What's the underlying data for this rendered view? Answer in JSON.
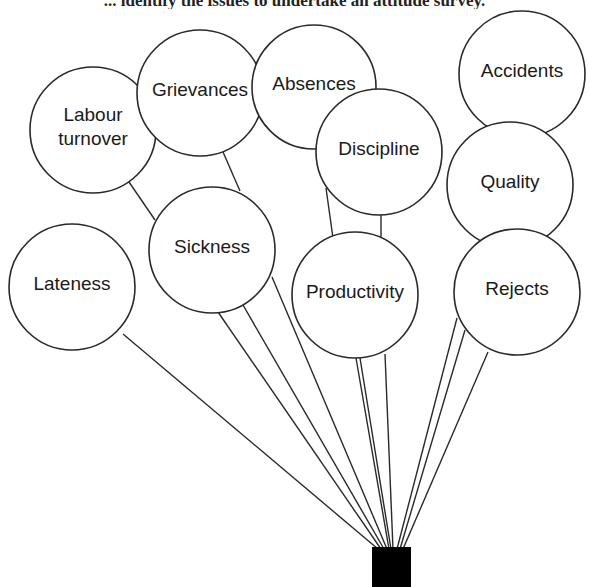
{
  "caption": "... identify the issues to undertake an attitude survey.",
  "colors": {
    "stroke": "#2a2a2a",
    "fill": "#ffffff",
    "box": "#000000",
    "text": "#1a1a1a"
  },
  "anchor": {
    "x": 372,
    "y": 547,
    "w": 39,
    "h": 40
  },
  "balloons": [
    {
      "id": "labour-turnover",
      "lines": [
        "Labour",
        "turnover"
      ],
      "cx": 93,
      "cy": 130,
      "r": 63
    },
    {
      "id": "grievances",
      "lines": [
        "Grievances"
      ],
      "cx": 200,
      "cy": 93,
      "r": 63
    },
    {
      "id": "absences",
      "lines": [
        "Absences"
      ],
      "cx": 314,
      "cy": 87,
      "r": 62
    },
    {
      "id": "discipline",
      "lines": [
        "Discipline"
      ],
      "cx": 379,
      "cy": 152,
      "r": 63
    },
    {
      "id": "accidents",
      "lines": [
        "Accidents"
      ],
      "cx": 522,
      "cy": 74,
      "r": 63
    },
    {
      "id": "quality",
      "lines": [
        "Quality"
      ],
      "cx": 510,
      "cy": 185,
      "r": 63
    },
    {
      "id": "lateness",
      "lines": [
        "Lateness"
      ],
      "cx": 72,
      "cy": 287,
      "r": 63
    },
    {
      "id": "sickness",
      "lines": [
        "Sickness"
      ],
      "cx": 212,
      "cy": 250,
      "r": 63
    },
    {
      "id": "productivity",
      "lines": [
        "Productivity"
      ],
      "cx": 355,
      "cy": 295,
      "r": 63
    },
    {
      "id": "rejects",
      "lines": [
        "Rejects"
      ],
      "cx": 517,
      "cy": 292,
      "r": 63
    }
  ],
  "strings": [
    {
      "from": "lateness",
      "x1": 123,
      "y1": 334,
      "x2": 378,
      "y2": 549
    },
    {
      "from": "sickness",
      "x1": 218,
      "y1": 312,
      "x2": 381,
      "y2": 549
    },
    {
      "from": "sickness",
      "x1": 243,
      "y1": 305,
      "x2": 384,
      "y2": 549
    },
    {
      "from": "sickness",
      "x1": 272,
      "y1": 277,
      "x2": 387,
      "y2": 549
    },
    {
      "from": "productivity",
      "x1": 356,
      "y1": 358,
      "x2": 389,
      "y2": 549
    },
    {
      "from": "productivity",
      "x1": 360,
      "y1": 358,
      "x2": 391,
      "y2": 549
    },
    {
      "from": "productivity",
      "x1": 385,
      "y1": 354,
      "x2": 393,
      "y2": 549
    },
    {
      "from": "rejects",
      "x1": 457,
      "y1": 318,
      "x2": 397,
      "y2": 549
    },
    {
      "from": "rejects",
      "x1": 465,
      "y1": 330,
      "x2": 400,
      "y2": 549
    },
    {
      "from": "rejects",
      "x1": 488,
      "y1": 352,
      "x2": 403,
      "y2": 549
    },
    {
      "from": "labour-turnover",
      "x1": 129,
      "y1": 182,
      "x2": 155,
      "y2": 220
    },
    {
      "from": "grievances",
      "x1": 223,
      "y1": 152,
      "x2": 240,
      "y2": 191
    },
    {
      "from": "discipline",
      "x1": 326,
      "y1": 188,
      "x2": 333,
      "y2": 238
    },
    {
      "from": "discipline",
      "x1": 381,
      "y1": 213,
      "x2": 381,
      "y2": 239
    },
    {
      "from": "quality",
      "x1": 477,
      "y1": 238,
      "x2": 480,
      "y2": 240
    }
  ]
}
